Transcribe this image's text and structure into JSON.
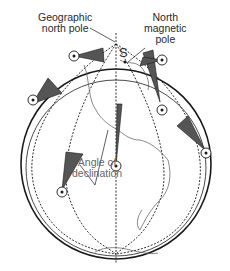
{
  "labels": {
    "geographic_pole_line1": "Geographic",
    "geographic_pole_line2": "north pole",
    "magnetic_pole_line1": "North",
    "magnetic_pole_line2": "magnetic",
    "magnetic_pole_line3": "pole",
    "declination_line1": "Angle of",
    "declination_line2": "declination",
    "south_pole_of_magnet": "S"
  },
  "colors": {
    "stroke": "#1a1a1a",
    "wedge_fill": "#555555",
    "land_stroke": "#444444",
    "label_gray": "#666666"
  }
}
